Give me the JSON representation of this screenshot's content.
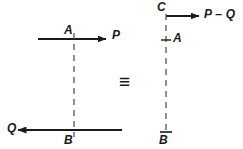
{
  "figure": {
    "equivalence_symbol": "≡",
    "stroke_color": "#1a1a1a",
    "dashed_color": "#555555",
    "background": "#ffffff"
  },
  "left_system": {
    "top_force_label": "P",
    "top_point_label": "A",
    "bottom_force_label": "Q",
    "bottom_point_label": "B",
    "top_arrow": {
      "x1": 38,
      "y1": 39,
      "x2": 106,
      "y2": 39,
      "direction": "right"
    },
    "bottom_arrow": {
      "x1": 122,
      "y1": 130,
      "x2": 18,
      "y2": 130,
      "direction": "left"
    },
    "dashed_line": {
      "x": 74,
      "y1": 41,
      "y2": 130
    }
  },
  "right_system": {
    "resultant_label": "P – Q",
    "top_point_label": "C",
    "mid_point_label": "A",
    "bottom_point_label": "B",
    "arrow": {
      "x1": 166,
      "y1": 16,
      "x2": 199,
      "y2": 16,
      "direction": "right"
    },
    "dashed_line": {
      "x": 166,
      "y1": 14,
      "y2": 134
    },
    "tick_A": {
      "x": 166,
      "y": 40,
      "width": 9
    },
    "tick_B": {
      "x": 166,
      "y": 132,
      "width": 11
    }
  }
}
